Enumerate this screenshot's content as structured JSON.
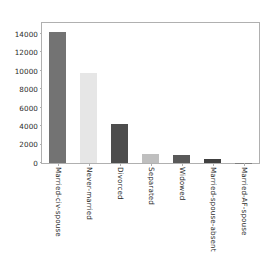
{
  "chart_data": {
    "type": "bar",
    "title": "",
    "xlabel": "",
    "ylabel": "",
    "categories": [
      "Married-civ-spouse",
      "Never-married",
      "Divorced",
      "Separated",
      "Widowed",
      "Married-spouse-absent",
      "Married-AF-spouse"
    ],
    "values": [
      14200,
      9800,
      4200,
      1000,
      900,
      400,
      20
    ],
    "ylim": [
      0,
      15200
    ],
    "yticks": [
      0,
      2000,
      4000,
      6000,
      8000,
      10000,
      12000,
      14000
    ],
    "ytick_labels": [
      "0",
      "2000",
      "4000",
      "6000",
      "8000",
      "10000",
      "12000",
      "14000"
    ],
    "grid": false,
    "legend": false,
    "bar_colors": [
      "#737373",
      "#e6e6e6",
      "#4d4d4d",
      "#bfbfbf",
      "#595959",
      "#404040",
      "#808080"
    ],
    "axis_color": "#b0b0b0",
    "tick_label_color": "#2b2b2b",
    "background": "#ffffff",
    "xtick_rotation": 90
  }
}
